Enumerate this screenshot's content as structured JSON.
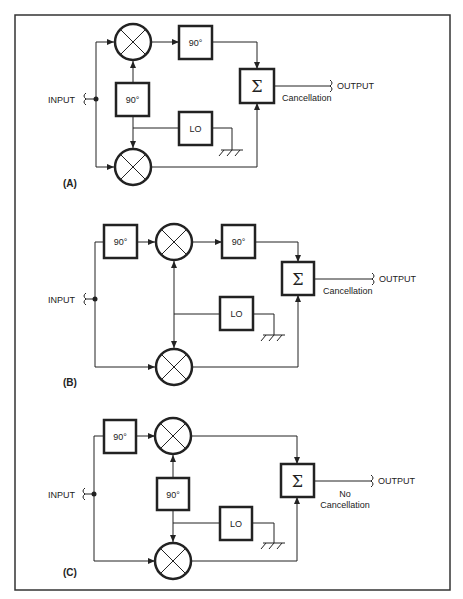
{
  "figure": {
    "border_color": "#333333",
    "line_color": "#222222",
    "panels": [
      {
        "id": "A",
        "label": "(A)",
        "input_label": "INPUT",
        "output_label": "OUTPUT",
        "result_line1": "",
        "result_line2": "Cancellation",
        "blocks": {
          "phase_top": "",
          "phase_center": "90°",
          "phase_after_mixer": "90°",
          "lo": "LO",
          "sum": "Σ"
        }
      },
      {
        "id": "B",
        "label": "(B)",
        "input_label": "INPUT",
        "output_label": "OUTPUT",
        "result_line1": "",
        "result_line2": "Cancellation",
        "blocks": {
          "phase_input": "90°",
          "phase_after_mixer": "90°",
          "lo": "LO",
          "sum": "Σ"
        }
      },
      {
        "id": "C",
        "label": "(C)",
        "input_label": "INPUT",
        "output_label": "OUTPUT",
        "result_line1": "No",
        "result_line2": "Cancellation",
        "blocks": {
          "phase_input": "90°",
          "phase_center": "90°",
          "lo": "LO",
          "sum": "Σ"
        }
      }
    ]
  }
}
